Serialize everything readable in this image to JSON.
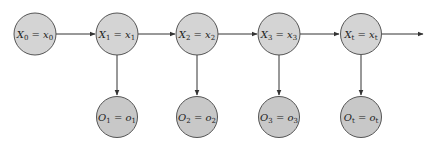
{
  "diagram": {
    "colors": {
      "node_fill": "#d4d4d4",
      "node_stroke": "#555555",
      "edge": "#333333",
      "background": "#ffffff"
    },
    "hidden_states": [
      {
        "id": "X0",
        "var": "X",
        "sub": "0",
        "val": "x",
        "valsub": "0",
        "label": "X0 = x0",
        "cx": 35,
        "cy": 34
      },
      {
        "id": "X1",
        "var": "X",
        "sub": "1",
        "val": "x",
        "valsub": "1",
        "label": "X1 = x1",
        "cx": 117,
        "cy": 34
      },
      {
        "id": "X2",
        "var": "X",
        "sub": "2",
        "val": "x",
        "valsub": "2",
        "label": "X2 = x2",
        "cx": 197,
        "cy": 34
      },
      {
        "id": "X3",
        "var": "X",
        "sub": "3",
        "val": "x",
        "valsub": "3",
        "label": "X3 = x3",
        "cx": 279,
        "cy": 34
      },
      {
        "id": "Xt",
        "var": "X",
        "sub": "t",
        "val": "x",
        "valsub": "t",
        "label": "Xt = xt",
        "cx": 361,
        "cy": 34
      }
    ],
    "observations": [
      {
        "id": "O1",
        "var": "O",
        "sub": "1",
        "val": "o",
        "valsub": "1",
        "label": "O1 = o1",
        "cx": 117,
        "cy": 117
      },
      {
        "id": "O2",
        "var": "O",
        "sub": "2",
        "val": "o",
        "valsub": "2",
        "label": "O2 = o2",
        "cx": 197,
        "cy": 117
      },
      {
        "id": "O3",
        "var": "O",
        "sub": "3",
        "val": "o",
        "valsub": "3",
        "label": "O3 = o3",
        "cx": 279,
        "cy": 117
      },
      {
        "id": "Ot",
        "var": "O",
        "sub": "t",
        "val": "o",
        "valsub": "t",
        "label": "Ot = ot",
        "cx": 361,
        "cy": 117
      }
    ],
    "edges": [
      {
        "from": "X0",
        "to": "X1"
      },
      {
        "from": "X1",
        "to": "X2"
      },
      {
        "from": "X2",
        "to": "X3"
      },
      {
        "from": "X3",
        "to": "Xt"
      },
      {
        "from": "Xt",
        "to": "continuation"
      },
      {
        "from": "X1",
        "to": "O1"
      },
      {
        "from": "X2",
        "to": "O2"
      },
      {
        "from": "X3",
        "to": "O3"
      },
      {
        "from": "Xt",
        "to": "Ot"
      }
    ]
  }
}
